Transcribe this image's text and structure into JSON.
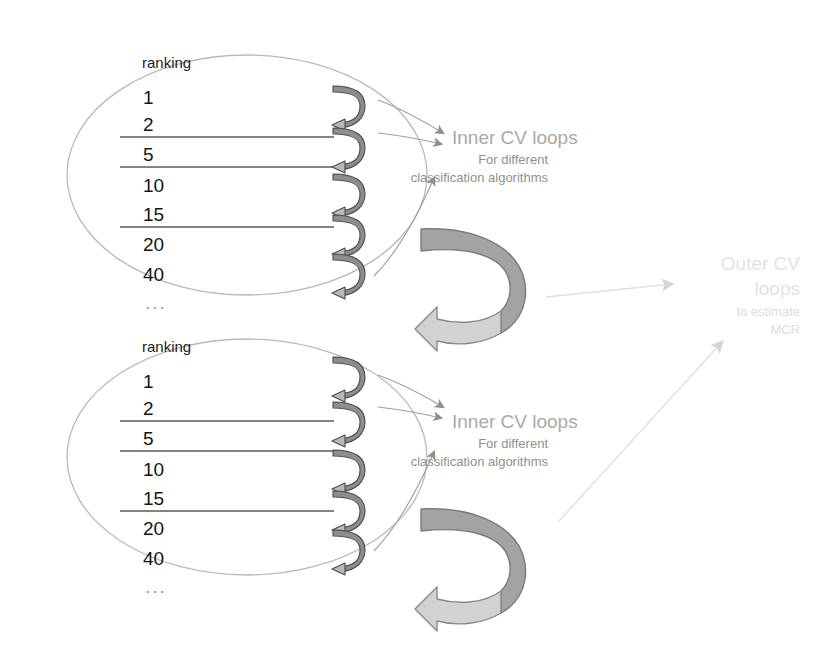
{
  "figure": {
    "background_color": "#ffffff",
    "width": 830,
    "height": 660
  },
  "colors": {
    "ellipse_stroke": "#b9b9b9",
    "divider_line": "#5a5a5a",
    "rank_text": "#141414",
    "loop_arrow_dark": "#8a8a8a",
    "loop_arrow_light": "#c6c6c6",
    "loop_arrow_outline": "#4a4a4a",
    "big_arrow_dark": "#a3a3a3",
    "big_arrow_light": "#d2d2d2",
    "big_arrow_outline": "#7a7a7a",
    "inner_label": "#a9a9a9",
    "inner_sublabel": "#8f8f8f",
    "outer_label": "#e2e2e2",
    "outer_sublabel": "#dcdcdc",
    "thin_arrow": "#9e9e9e",
    "outer_thin_arrow": "#dedede"
  },
  "blocks": [
    {
      "id": "block-top",
      "ranking_header": "ranking",
      "rank_values": [
        "1",
        "2",
        "5",
        "10",
        "15",
        "20",
        "40"
      ],
      "ellipsis": "...",
      "dividers_after": [
        "2",
        "5",
        "15"
      ],
      "loop_count": 5,
      "inner_label": {
        "title": "Inner CV loops",
        "line1": "For different",
        "line2": "classification algorithms"
      }
    },
    {
      "id": "block-bottom",
      "ranking_header": "ranking",
      "rank_values": [
        "1",
        "2",
        "5",
        "10",
        "15",
        "20",
        "40"
      ],
      "ellipsis": "...",
      "dividers_after": [
        "2",
        "5",
        "15"
      ],
      "loop_count": 5,
      "inner_label": {
        "title": "Inner CV loops",
        "line1": "For different",
        "line2": "classification algorithms"
      }
    }
  ],
  "outer_label": {
    "title_line1": "Outer CV",
    "title_line2": "loops",
    "sub_line1": "to estimate",
    "sub_line2": "MCR"
  }
}
